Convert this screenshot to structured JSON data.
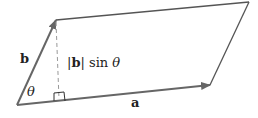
{
  "diagram": {
    "type": "parallelogram",
    "labels": {
      "vector_b": "b",
      "vector_a": "a",
      "angle": "θ",
      "height_bar_open": "|",
      "height_b": "b",
      "height_bar_close": "|",
      "height_sin": " sin ",
      "height_theta": "θ"
    },
    "colors": {
      "stroke": "#555555",
      "dashed": "#999999",
      "text": "#222222"
    }
  }
}
